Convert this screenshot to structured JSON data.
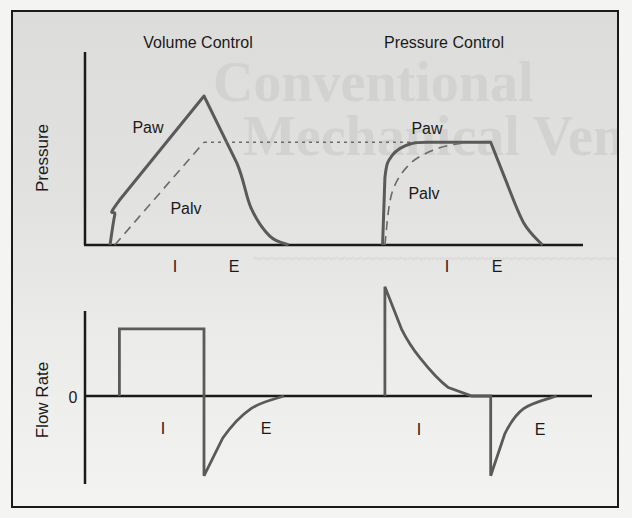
{
  "figure": {
    "titles": {
      "volume_control": "Volume Control",
      "pressure_control": "Pressure Control"
    },
    "axes": {
      "pressure_label": "Pressure",
      "flow_label": "Flow Rate",
      "flow_zero_tick": "0"
    },
    "curve_labels": {
      "vc_paw": "Paw",
      "vc_palv": "Palv",
      "pc_paw": "Paw",
      "pc_palv": "Palv"
    },
    "phase_labels": {
      "pressure_vc_inspiration": "I",
      "pressure_vc_expiration": "E",
      "pressure_pc_inspiration": "I",
      "pressure_pc_expiration": "E",
      "flow_vc_inspiration": "I",
      "flow_vc_expiration": "E",
      "flow_pc_inspiration": "I",
      "flow_pc_expiration": "E"
    },
    "colors": {
      "curve": "#5a5a5a",
      "axis": "#1a1a1a",
      "dashed": "#6a6a6a"
    }
  },
  "chart_data": [
    {
      "type": "line",
      "title": "Pressure",
      "ylabel": "Pressure",
      "xlabel": "",
      "note": "Schematic waveforms, no numeric scale; values normalized 0-1 (pressure) over normalized time",
      "series": [
        {
          "name": "Volume Control Paw",
          "style": "solid",
          "x": [
            0.0,
            0.01,
            0.02,
            0.2,
            0.27,
            0.3,
            0.34,
            0.38
          ],
          "y": [
            0.0,
            0.2,
            0.3,
            1.0,
            0.55,
            0.25,
            0.06,
            0.0
          ]
        },
        {
          "name": "Volume Control Palv",
          "style": "dashed",
          "x": [
            0.01,
            0.2
          ],
          "y": [
            0.0,
            0.69
          ]
        },
        {
          "name": "Pressure Control Paw",
          "style": "solid",
          "x": [
            0.58,
            0.585,
            0.6,
            0.64,
            0.7,
            0.81,
            0.84,
            0.88,
            0.92
          ],
          "y": [
            0.0,
            0.45,
            0.6,
            0.68,
            0.69,
            0.69,
            0.45,
            0.15,
            0.0
          ]
        },
        {
          "name": "Pressure Control Palv",
          "style": "dashed",
          "x": [
            0.585,
            0.6,
            0.64,
            0.7,
            0.76
          ],
          "y": [
            0.0,
            0.35,
            0.55,
            0.65,
            0.69
          ]
        },
        {
          "name": "Peak reference",
          "style": "dotted",
          "x": [
            0.2,
            0.81
          ],
          "y": [
            0.69,
            0.69
          ]
        }
      ]
    },
    {
      "type": "line",
      "title": "Flow Rate",
      "ylabel": "Flow Rate",
      "yticks": [
        "0"
      ],
      "note": "Schematic; flow normalized, 0 = zero line",
      "series": [
        {
          "name": "Volume Control Flow",
          "x": [
            0.02,
            0.02,
            0.2,
            0.2,
            0.24,
            0.3,
            0.37
          ],
          "y": [
            0.0,
            0.8,
            0.8,
            -0.95,
            -0.5,
            -0.15,
            0.0
          ]
        },
        {
          "name": "Pressure Control Flow",
          "x": [
            0.585,
            0.585,
            0.62,
            0.66,
            0.72,
            0.77,
            0.81,
            0.81,
            0.84,
            0.88,
            0.95
          ],
          "y": [
            0.0,
            1.3,
            0.8,
            0.45,
            0.1,
            0.0,
            0.0,
            -0.95,
            -0.45,
            -0.15,
            0.0
          ]
        }
      ]
    }
  ]
}
